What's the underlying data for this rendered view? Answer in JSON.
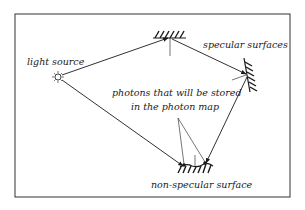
{
  "diagram": {
    "type": "photon-map-illustration",
    "labels": {
      "light_source": "light source",
      "specular_surfaces": "specular surfaces",
      "stored_photons_line1": "photons that will be stored",
      "stored_photons_line2": "in the photon map",
      "non_specular_surface": "non-specular surface"
    },
    "nodes": [
      {
        "id": "light-source",
        "kind": "light"
      },
      {
        "id": "specular-top",
        "kind": "specular-surface"
      },
      {
        "id": "specular-right",
        "kind": "specular-surface"
      },
      {
        "id": "non-specular",
        "kind": "diffuse-surface"
      }
    ],
    "edges": [
      {
        "from": "light-source",
        "to": "specular-top"
      },
      {
        "from": "specular-top",
        "to": "specular-right"
      },
      {
        "from": "specular-right",
        "to": "non-specular"
      },
      {
        "from": "light-source",
        "to": "non-specular"
      }
    ],
    "colors": {
      "ink": "#1a1a1a",
      "background": "#ffffff"
    }
  }
}
